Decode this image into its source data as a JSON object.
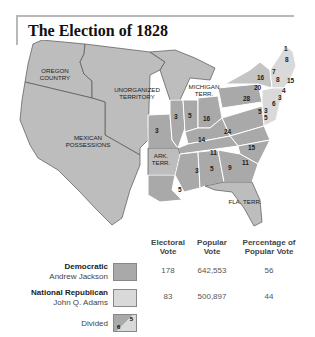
{
  "title": "The Election of 1828",
  "colors": {
    "democratic": "#a9a9a9",
    "national_republican": "#d9d9d9",
    "territory": "#bdbdbd",
    "border": "#555555"
  },
  "map": {
    "region_labels": [
      {
        "name": "oregon",
        "text1": "OREGON",
        "text2": "COUNTRY"
      },
      {
        "name": "unorganized",
        "text1": "UNORGANIZED",
        "text2": "TERRITORY"
      },
      {
        "name": "mexican",
        "text1": "MEXICAN",
        "text2": "POSSESSIONS"
      },
      {
        "name": "michigan",
        "text1": "MICHIGAN",
        "text2": "TERR."
      },
      {
        "name": "arkansas",
        "text1": "ARK.",
        "text2": "TERR."
      },
      {
        "name": "florida",
        "text1": "FLA. TERR.",
        "text2": ""
      }
    ],
    "state_votes": [
      "1",
      "8",
      "7",
      "8",
      "15",
      "16",
      "20",
      "28",
      "4",
      "3",
      "6",
      "5",
      "3",
      "5",
      "3",
      "3",
      "5",
      "16",
      "14",
      "24",
      "15",
      "11",
      "11",
      "3",
      "5",
      "9",
      "5"
    ]
  },
  "legend": {
    "headers": {
      "electoral": [
        "Electoral",
        "Vote"
      ],
      "popular": [
        "Popular",
        "Vote"
      ],
      "percentage": [
        "Percentage of",
        "Popular Vote"
      ]
    },
    "rows": [
      {
        "party": "Democratic",
        "candidate": "Andrew Jackson",
        "electoral": "178",
        "popular": "642,553",
        "percentage": "56"
      },
      {
        "party": "National Republican",
        "candidate": "John Q. Adams",
        "electoral": "83",
        "popular": "500,897",
        "percentage": "44"
      }
    ],
    "divided": {
      "label": "Divided",
      "num_a": "6",
      "num_b": "5"
    }
  }
}
